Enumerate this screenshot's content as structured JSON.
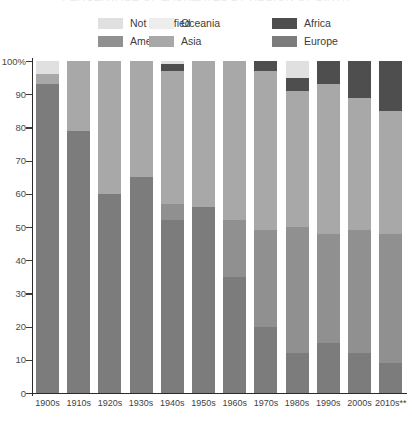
{
  "title": "PERCENTAGE OF LAUREATES BY REGION OF BIRTH",
  "legend": [
    {
      "label": "Not specified",
      "color": "#e0e0e0"
    },
    {
      "label": "Oceania",
      "color": "#ededed"
    },
    {
      "label": "Africa",
      "color": "#4e4e4e"
    },
    {
      "label": "Americas",
      "color": "#909090"
    },
    {
      "label": "Asia",
      "color": "#a8a8a8"
    },
    {
      "label": "Europe",
      "color": "#7c7c7c"
    }
  ],
  "axis": {
    "y_ticks": [
      "0",
      "10",
      "20",
      "30",
      "40",
      "50",
      "60",
      "70",
      "80",
      "90",
      "100%"
    ],
    "y_min": 0,
    "y_max": 100,
    "x_labels": [
      "1900s",
      "1910s",
      "1920s",
      "1930s",
      "1940s",
      "1950s",
      "1960s",
      "1970s",
      "1980s",
      "1990s",
      "2000s",
      "2010s**"
    ]
  },
  "chart_data": {
    "type": "bar",
    "subtype": "stacked-100-percent",
    "title": "PERCENTAGE OF LAUREATES BY REGION OF BIRTH",
    "xlabel": "",
    "ylabel": "",
    "ylim": [
      0,
      100
    ],
    "grid": false,
    "legend_position": "top",
    "stack_order_bottom_to_top": [
      "Europe",
      "Americas",
      "Asia",
      "Africa",
      "Oceania",
      "Not specified"
    ],
    "categories": [
      "1900s",
      "1910s",
      "1920s",
      "1930s",
      "1940s",
      "1950s",
      "1960s",
      "1970s",
      "1980s",
      "1990s",
      "2000s",
      "2010s**"
    ],
    "series": [
      {
        "name": "Europe",
        "color": "#7c7c7c",
        "values": [
          93,
          79,
          60,
          65,
          52,
          56,
          35,
          20,
          12,
          15,
          12,
          9
        ]
      },
      {
        "name": "Americas",
        "color": "#909090",
        "values": [
          0,
          0,
          0,
          0,
          5,
          0,
          17,
          29,
          38,
          33,
          37,
          39
        ]
      },
      {
        "name": "Asia",
        "color": "#a8a8a8",
        "values": [
          3,
          21,
          40,
          35,
          40,
          44,
          48,
          48,
          41,
          45,
          40,
          37
        ]
      },
      {
        "name": "Africa",
        "color": "#4e4e4e",
        "values": [
          0,
          0,
          0,
          0,
          2,
          0,
          0,
          3,
          4,
          7,
          11,
          15
        ]
      },
      {
        "name": "Oceania",
        "color": "#ededed",
        "values": [
          0,
          0,
          0,
          0,
          0,
          0,
          0,
          0,
          0,
          0,
          0,
          0
        ]
      },
      {
        "name": "Not specified",
        "color": "#e0e0e0",
        "values": [
          4,
          0,
          0,
          0,
          1,
          0,
          0,
          0,
          5,
          0,
          0,
          0
        ]
      }
    ]
  }
}
